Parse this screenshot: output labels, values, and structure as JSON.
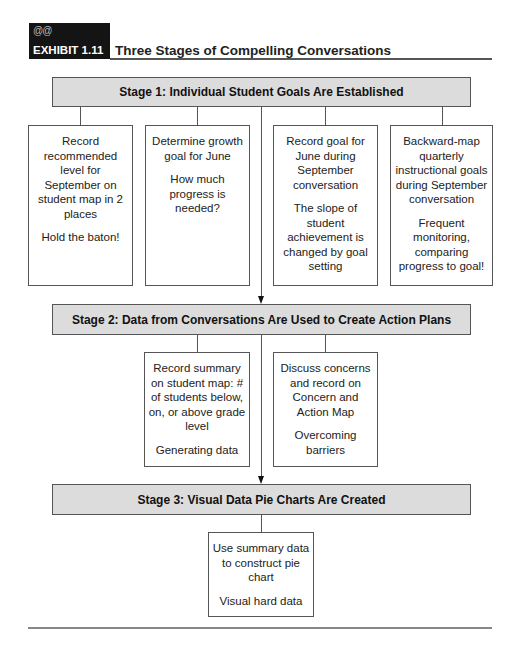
{
  "exhibit": {
    "ornament": "@@",
    "label": "EXHIBIT 1.11",
    "title": "Three Stages of Compelling Conversations"
  },
  "stages": [
    {
      "title": "Stage 1: Individual Student Goals Are Established",
      "boxes": [
        {
          "main": "Record recommended level for September on student map in 2 places",
          "note": "Hold the baton!"
        },
        {
          "main": "Determine growth goal for June",
          "note": "How much progress is needed?"
        },
        {
          "main": "Record goal for June during September conversation",
          "note": "The slope of student achievement is changed by goal setting"
        },
        {
          "main": "Backward-map quarterly instructional goals during September conversation",
          "note": "Frequent monitoring, comparing progress to goal!"
        }
      ]
    },
    {
      "title": "Stage 2: Data from Conversations Are Used to Create Action Plans",
      "boxes": [
        {
          "main": "Record summary on student map: # of students below, on, or above grade level",
          "note": "Generating data"
        },
        {
          "main": "Discuss concerns and record on Concern and Action Map",
          "note": "Overcoming barriers"
        }
      ]
    },
    {
      "title": "Stage 3: Visual Data Pie Charts Are Created",
      "boxes": [
        {
          "main": "Use summary data to construct pie chart",
          "note": "Visual hard data"
        }
      ]
    }
  ]
}
